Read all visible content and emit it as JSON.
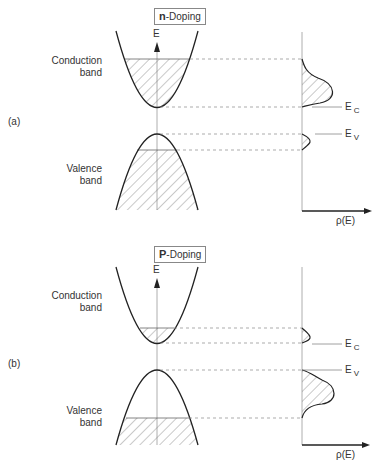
{
  "panels": [
    {
      "id": "a",
      "tag": "(a)",
      "title_bold": "n",
      "title_rest": "-Doping",
      "energy_axis_label": "E",
      "conduction_label_1": "Conduction",
      "conduction_label_2": "band",
      "valence_label_1": "Valence",
      "valence_label_2": "band",
      "ec_label": "E",
      "ec_sub": "C",
      "ev_label": "E",
      "ev_sub": "V",
      "dos_axis_label": "ρ(E)"
    },
    {
      "id": "b",
      "tag": "(b)",
      "title_bold": "P",
      "title_rest": "-Doping",
      "energy_axis_label": "E",
      "conduction_label_1": "Conduction",
      "conduction_label_2": "band",
      "valence_label_1": "Valence",
      "valence_label_2": "band",
      "ec_label": "E",
      "ec_sub": "C",
      "ev_label": "E",
      "ev_sub": "V",
      "dos_axis_label": "ρ(E)"
    }
  ],
  "colors": {
    "line": "#333333",
    "dashed": "#888888",
    "hatch": "#777777"
  }
}
